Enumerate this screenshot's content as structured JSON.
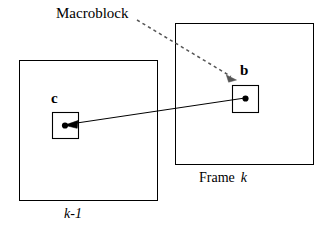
{
  "diagram": {
    "title_note": "Macroblock motion estimation between consecutive video frames",
    "background_color": "#ffffff",
    "stroke_color": "#000000",
    "labels": {
      "macroblock": "Macroblock",
      "block_b": "b",
      "block_c": "c",
      "frame_k_prefix": "Frame",
      "frame_k_index": "k",
      "frame_km1": "k-1"
    },
    "frames": [
      {
        "name": "previous-frame",
        "label": "k-1",
        "x": 19,
        "y": 60,
        "width": 138,
        "height": 140
      },
      {
        "name": "current-frame",
        "label": "Frame k",
        "x": 175,
        "y": 23,
        "width": 138,
        "height": 141
      }
    ],
    "macroblocks": [
      {
        "name": "macroblock-c",
        "label": "c",
        "x": 52,
        "y": 112,
        "width": 26,
        "height": 26,
        "center_x": 65,
        "center_y": 125
      },
      {
        "name": "macroblock-b",
        "label": "b",
        "x": 232,
        "y": 85,
        "width": 26,
        "height": 27,
        "center_x": 245,
        "center_y": 98
      }
    ],
    "arrows": [
      {
        "name": "motion-vector-arrow",
        "style": "solid",
        "from_x": 245,
        "from_y": 98,
        "to_x": 67,
        "to_y": 124,
        "head_at": "to"
      },
      {
        "name": "macroblock-callout-arrow",
        "style": "dashed",
        "from_x": 137,
        "from_y": 20,
        "to_x": 236,
        "to_y": 80,
        "head_at": "to"
      }
    ]
  }
}
